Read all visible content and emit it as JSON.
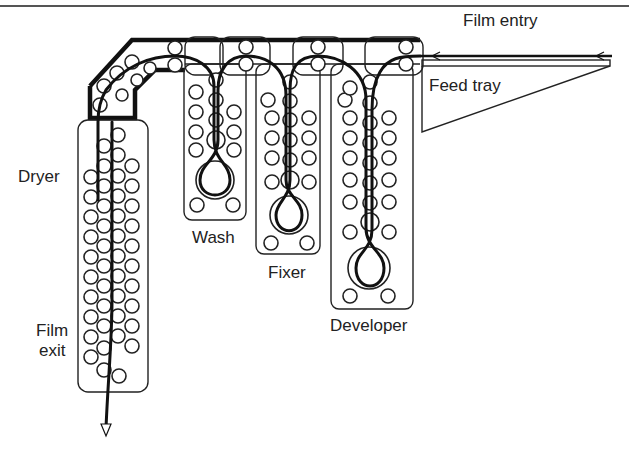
{
  "diagram": {
    "type": "film processor schematic",
    "labels": {
      "film_entry": "Film entry",
      "feed_tray": "Feed tray",
      "dryer": "Dryer",
      "wash": "Wash",
      "fixer": "Fixer",
      "developer": "Developer",
      "film_exit_line1": "Film",
      "film_exit_line2": "exit"
    },
    "sections": [
      {
        "name": "Developer",
        "order": 1
      },
      {
        "name": "Fixer",
        "order": 2
      },
      {
        "name": "Wash",
        "order": 3
      },
      {
        "name": "Dryer",
        "order": 4
      }
    ],
    "flow": "Film entry → Feed tray → Developer → Fixer → Wash → Dryer → Film exit",
    "colors": {
      "line": "#111111",
      "background": "#ffffff"
    }
  }
}
